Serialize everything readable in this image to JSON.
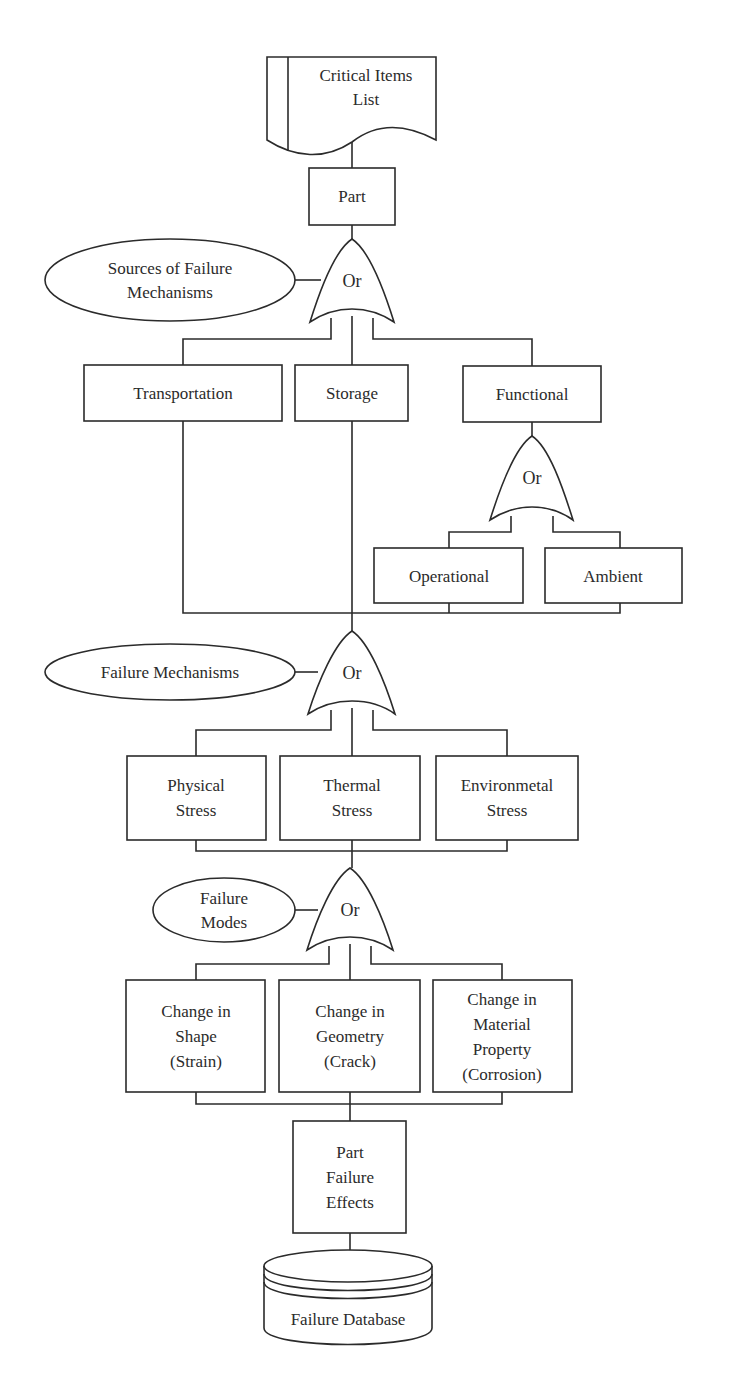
{
  "diagram": {
    "type": "fault-tree-flowchart",
    "colors": {
      "stroke": "#2b2b2b",
      "fill": "#ffffff",
      "text": "#2b2b2b"
    },
    "nodes": {
      "critical_items_list": {
        "shape": "document",
        "lines": [
          "Critical Items",
          "List"
        ]
      },
      "part": {
        "shape": "box",
        "lines": [
          "Part"
        ]
      },
      "sources_label": {
        "shape": "ellipse",
        "lines": [
          "Sources of Failure",
          "Mechanisms"
        ]
      },
      "gate_sources": {
        "shape": "or-gate",
        "label": "Or"
      },
      "transportation": {
        "shape": "box",
        "lines": [
          "Transportation"
        ]
      },
      "storage": {
        "shape": "box",
        "lines": [
          "Storage"
        ]
      },
      "functional": {
        "shape": "box",
        "lines": [
          "Functional"
        ]
      },
      "gate_functional": {
        "shape": "or-gate",
        "label": "Or"
      },
      "operational": {
        "shape": "box",
        "lines": [
          "Operational"
        ]
      },
      "ambient": {
        "shape": "box",
        "lines": [
          "Ambient"
        ]
      },
      "mechanisms_label": {
        "shape": "ellipse",
        "lines": [
          "Failure Mechanisms"
        ]
      },
      "gate_mechanisms": {
        "shape": "or-gate",
        "label": "Or"
      },
      "physical_stress": {
        "shape": "box",
        "lines": [
          "Physical",
          "Stress"
        ]
      },
      "thermal_stress": {
        "shape": "box",
        "lines": [
          "Thermal",
          "Stress"
        ]
      },
      "environmental_stress": {
        "shape": "box",
        "lines": [
          "Environmetal",
          "Stress"
        ]
      },
      "modes_label": {
        "shape": "ellipse",
        "lines": [
          "Failure",
          "Modes"
        ]
      },
      "gate_modes": {
        "shape": "or-gate",
        "label": "Or"
      },
      "change_shape": {
        "shape": "box",
        "lines": [
          "Change in",
          "Shape",
          "(Strain)"
        ]
      },
      "change_geometry": {
        "shape": "box",
        "lines": [
          "Change in",
          "Geometry",
          "(Crack)"
        ]
      },
      "change_material": {
        "shape": "box",
        "lines": [
          "Change in",
          "Material",
          "Property",
          "(Corrosion)"
        ]
      },
      "part_failure_effects": {
        "shape": "box",
        "lines": [
          "Part",
          "Failure",
          "Effects"
        ]
      },
      "failure_database": {
        "shape": "database",
        "lines": [
          "Failure Database"
        ]
      }
    },
    "edges": [
      [
        "critical_items_list",
        "part"
      ],
      [
        "part",
        "gate_sources"
      ],
      [
        "sources_label",
        "gate_sources"
      ],
      [
        "gate_sources",
        "transportation"
      ],
      [
        "gate_sources",
        "storage"
      ],
      [
        "gate_sources",
        "functional"
      ],
      [
        "functional",
        "gate_functional"
      ],
      [
        "gate_functional",
        "operational"
      ],
      [
        "gate_functional",
        "ambient"
      ],
      [
        "transportation",
        "gate_mechanisms"
      ],
      [
        "storage",
        "gate_mechanisms"
      ],
      [
        "operational",
        "gate_mechanisms"
      ],
      [
        "ambient",
        "gate_mechanisms"
      ],
      [
        "mechanisms_label",
        "gate_mechanisms"
      ],
      [
        "gate_mechanisms",
        "physical_stress"
      ],
      [
        "gate_mechanisms",
        "thermal_stress"
      ],
      [
        "gate_mechanisms",
        "environmental_stress"
      ],
      [
        "physical_stress",
        "gate_modes"
      ],
      [
        "thermal_stress",
        "gate_modes"
      ],
      [
        "environmental_stress",
        "gate_modes"
      ],
      [
        "modes_label",
        "gate_modes"
      ],
      [
        "gate_modes",
        "change_shape"
      ],
      [
        "gate_modes",
        "change_geometry"
      ],
      [
        "gate_modes",
        "change_material"
      ],
      [
        "change_shape",
        "part_failure_effects"
      ],
      [
        "change_geometry",
        "part_failure_effects"
      ],
      [
        "change_material",
        "part_failure_effects"
      ],
      [
        "part_failure_effects",
        "failure_database"
      ]
    ]
  }
}
